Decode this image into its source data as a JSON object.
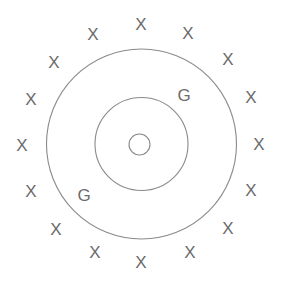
{
  "figure": {
    "background_color": "#ffffff",
    "stroke_color": "#8a8a8a",
    "text_color": "#6b6b6b",
    "canvas": {
      "width": 283,
      "height": 285
    },
    "center": {
      "x": 141.5,
      "y": 144
    }
  },
  "circles": [
    {
      "name": "outer-circle",
      "cx": 141.5,
      "cy": 144,
      "r": 95,
      "stroke": "#8a8a8a",
      "stroke_width": 1.1
    },
    {
      "name": "middle-circle",
      "cx": 141.5,
      "cy": 144,
      "r": 46.5,
      "stroke": "#8a8a8a",
      "stroke_width": 1.1
    },
    {
      "name": "inner-circle",
      "cx": 139.5,
      "cy": 144.5,
      "r": 10.5,
      "stroke": "#8a8a8a",
      "stroke_width": 1.1
    }
  ],
  "x_marks": {
    "label": "X",
    "count": 16,
    "ring_radius": 123,
    "positions": [
      {
        "x": 141,
        "y": 24
      },
      {
        "x": 188,
        "y": 33
      },
      {
        "x": 228,
        "y": 59
      },
      {
        "x": 251,
        "y": 97
      },
      {
        "x": 259,
        "y": 144
      },
      {
        "x": 251,
        "y": 190
      },
      {
        "x": 228,
        "y": 228
      },
      {
        "x": 190,
        "y": 252
      },
      {
        "x": 141,
        "y": 262
      },
      {
        "x": 95,
        "y": 252
      },
      {
        "x": 56,
        "y": 229
      },
      {
        "x": 31,
        "y": 191
      },
      {
        "x": 22,
        "y": 145
      },
      {
        "x": 31,
        "y": 99
      },
      {
        "x": 54,
        "y": 62
      },
      {
        "x": 93,
        "y": 34
      }
    ]
  },
  "g_marks": {
    "label": "G",
    "count": 2,
    "positions": [
      {
        "name": "g-label-upper-right",
        "x": 184,
        "y": 95
      },
      {
        "name": "g-label-lower-left",
        "x": 84,
        "y": 195
      }
    ]
  },
  "legend": {
    "x_meaning": "X",
    "g_meaning": "G",
    "o_meaning": "O"
  }
}
